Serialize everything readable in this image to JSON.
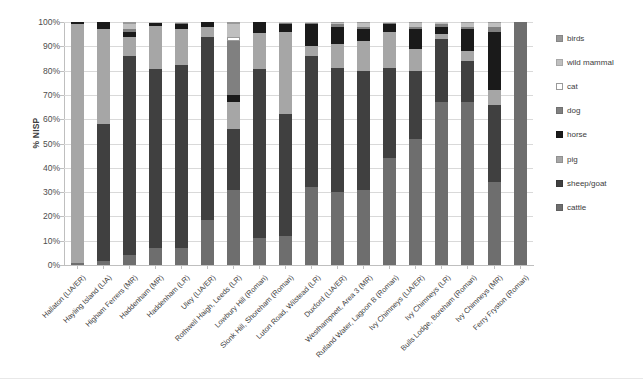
{
  "chart_data": {
    "type": "bar",
    "subtype": "stacked-bar-100",
    "title": "",
    "xlabel": "",
    "ylabel": "% NISP",
    "ylim": [
      0,
      100
    ],
    "ytick_labels": [
      "100%",
      "90%",
      "80%",
      "70%",
      "60%",
      "50%",
      "40%",
      "30%",
      "20%",
      "10%",
      "0%"
    ],
    "ytick_values": [
      100,
      90,
      80,
      70,
      60,
      50,
      40,
      30,
      20,
      10,
      0
    ],
    "grid": true,
    "legend_position": "right",
    "categories": [
      "Hallaton (LIA/ER)",
      "Hayling Island (LIA)",
      "Higham Ferrers (MR)",
      "Haddenham (MR)",
      "Haddenham (LR)",
      "Uley (LIA/ER)",
      "Rothwell Haigh, Leeds (LR)",
      "Lowbury Hill (Roman)",
      "Slonk Hill, Shoreham (Roman)",
      "Luton Road, Wilstead (LR)",
      "Duxford (LIA/ER)",
      "Westhampnett, Area 3 (MR)",
      "Rutland Water, Lagoon B (Roman)",
      "Ivy Chimneys (LIA/ER)",
      "Ivy Chimneys (LR)",
      "Bulls Lodge, Boreham (Roman)",
      "Ivy Chimneys (MR)",
      "Ferry Fryston (Roman)"
    ],
    "series": [
      {
        "name": "cattle",
        "color": "#6e6e6e",
        "values": [
          1,
          1.5,
          4,
          7,
          7,
          18.5,
          31,
          11,
          12,
          32,
          30,
          31,
          44,
          52,
          67,
          67,
          34,
          100
        ]
      },
      {
        "name": "sheep/goat",
        "color": "#404040",
        "values": [
          0,
          56.5,
          82,
          73.5,
          75.5,
          75.5,
          25,
          69.5,
          50,
          54,
          51,
          49,
          37,
          28,
          26,
          17,
          32,
          0
        ]
      },
      {
        "name": "pig",
        "color": "#a6a6a6",
        "values": [
          98,
          39,
          8,
          18,
          14.5,
          4,
          11,
          15,
          34,
          4,
          10,
          12,
          15,
          9,
          2,
          4,
          6,
          0
        ]
      },
      {
        "name": "horse",
        "color": "#1a1a1a",
        "values": [
          1,
          3,
          2,
          1,
          2,
          2,
          3,
          4.5,
          3,
          9,
          7,
          5,
          3,
          8,
          3,
          9,
          24,
          0
        ]
      },
      {
        "name": "dog",
        "color": "#808080",
        "values": [
          0,
          0,
          1,
          0,
          0.5,
          0,
          22,
          0,
          0.5,
          0.5,
          1,
          1,
          0.5,
          1,
          1,
          1,
          2,
          0
        ]
      },
      {
        "name": "cat",
        "color": "#ffffff",
        "values": [
          0,
          0,
          0,
          0,
          0,
          0,
          2,
          0,
          0,
          0,
          0,
          0,
          0,
          0,
          0,
          0,
          0,
          0
        ]
      },
      {
        "name": "wild mammal",
        "color": "#bfbfbf",
        "values": [
          0,
          0,
          2,
          0.5,
          0.5,
          0,
          5,
          0,
          0.5,
          0.5,
          0.5,
          1.5,
          0.5,
          1.5,
          1,
          1.5,
          1.5,
          0
        ]
      },
      {
        "name": "birds",
        "color": "#999999",
        "values": [
          0,
          0,
          1,
          0,
          0,
          0,
          1,
          0,
          0,
          0,
          0.5,
          0.5,
          0,
          0.5,
          0,
          0.5,
          0.5,
          0
        ]
      }
    ],
    "legend": [
      {
        "label": "birds",
        "color": "#999999"
      },
      {
        "label": "wild mammal",
        "color": "#bfbfbf"
      },
      {
        "label": "cat",
        "color": "#ffffff"
      },
      {
        "label": "dog",
        "color": "#808080"
      },
      {
        "label": "horse",
        "color": "#1a1a1a"
      },
      {
        "label": "pig",
        "color": "#a6a6a6"
      },
      {
        "label": "sheep/goat",
        "color": "#404040"
      },
      {
        "label": "cattle",
        "color": "#6e6e6e"
      }
    ]
  }
}
